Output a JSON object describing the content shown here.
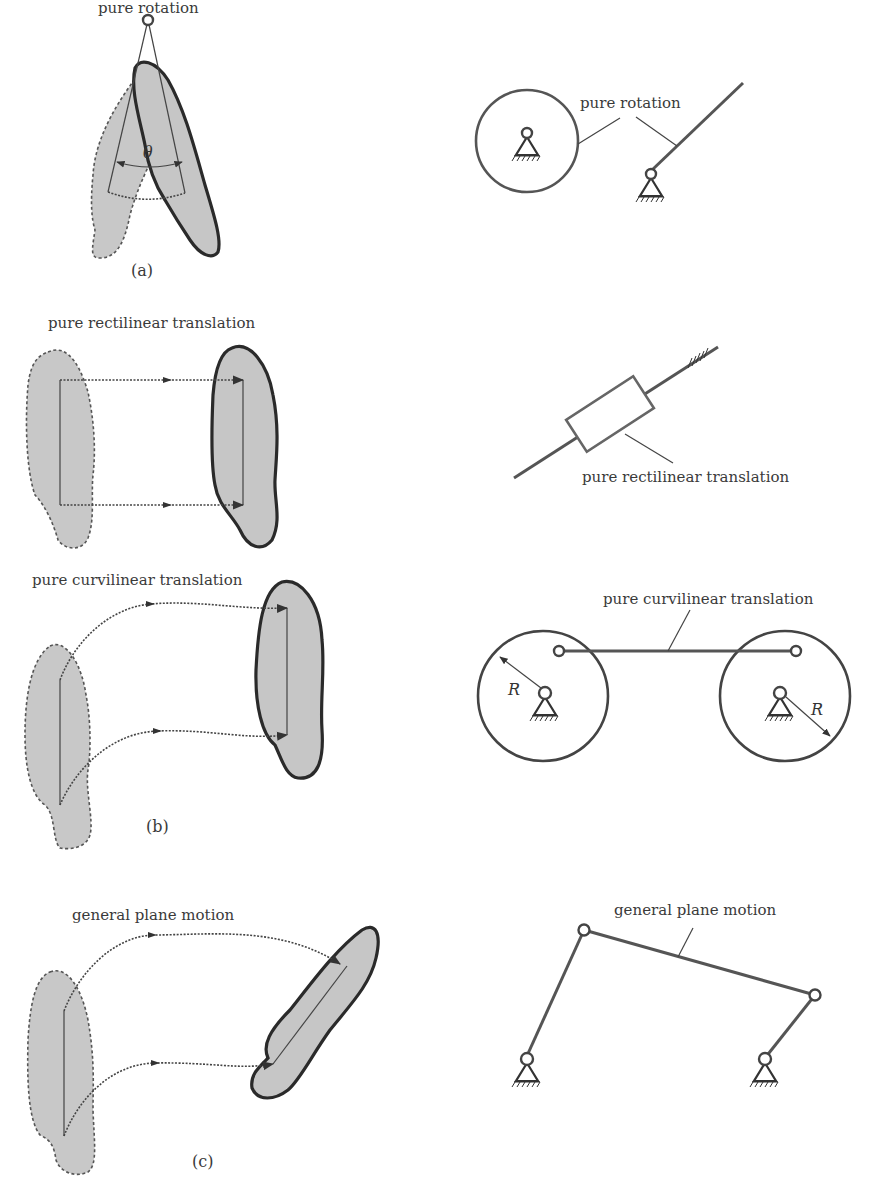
{
  "figure": {
    "panels": [
      {
        "id": "a",
        "caption": "(a)",
        "left_label": "pure rotation",
        "right_label": "pure rotation",
        "angle_symbol": "θ"
      },
      {
        "id": "b",
        "caption": "(b)",
        "rectilinear": {
          "left_label": "pure rectilinear translation",
          "right_label": "pure rectilinear translation"
        },
        "curvilinear": {
          "left_label": "pure curvilinear translation",
          "right_label": "pure curvilinear translation",
          "radius_symbol_left": "R",
          "radius_symbol_right": "R"
        }
      },
      {
        "id": "c",
        "caption": "(c)",
        "left_label": "general plane motion",
        "right_label": "general plane motion"
      }
    ],
    "colors": {
      "body_fill": "#c6c6c6",
      "body_outline": "#2a2a2a",
      "ghost_outline": "#555555",
      "link": "#555555"
    }
  }
}
